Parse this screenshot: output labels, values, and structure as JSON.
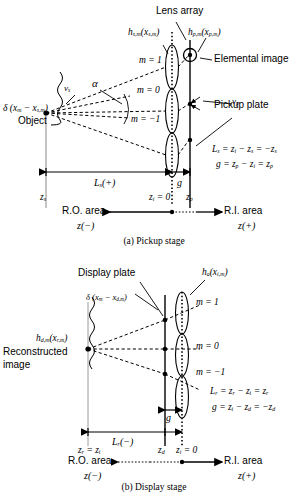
{
  "figure": {
    "colors": {
      "ink": "#000000",
      "paper": "#ffffff"
    }
  },
  "pickup": {
    "caption": "(a) Pickup stage",
    "labels": {
      "lens_array": "Lens array",
      "elemental_image": "Elemental image",
      "pickup_plate": "Pickup plate",
      "object": "Object",
      "h_s": "h",
      "h_s_sub": "s,m",
      "h_s_arg": "(x",
      "h_s_arg_sub": "s,m",
      "h_s_close": ")",
      "h_p": "h",
      "h_p_sub": "p,m",
      "h_p_arg": "(x",
      "h_p_arg_sub": "p,m",
      "h_p_close": ")",
      "delta": "δ (x",
      "delta_sub1": "m",
      "delta_mid": " − x",
      "delta_sub2": "s,m",
      "delta_close": ")",
      "alpha": "α",
      "v_s": "v",
      "v_s_sub": "s",
      "v_p": "v",
      "v_p_sub": "p",
      "m_plus1": "m = 1",
      "m_zero": "m = 0",
      "m_minus1": "m = −1",
      "Ls_span": "L",
      "Ls_span_sub": "s",
      "Ls_span_sign": "(+)",
      "g_span": "g",
      "z_s": "z",
      "z_s_sub": "s",
      "z_i_zero": "z",
      "z_i_zero_sub": "i",
      "z_i_zero_eq": " = 0",
      "z_p": "z",
      "z_p_sub": "p",
      "eq1": "L",
      "eq1_sub": "s",
      "eq1_rest": " = z",
      "eq1_sub2": "i",
      "eq1_rest2": " − z",
      "eq1_sub3": "s",
      "eq1_rest3": " = −z",
      "eq1_sub4": "s",
      "eq2": "g = z",
      "eq2_sub": "p",
      "eq2_rest": " − z",
      "eq2_sub2": "i",
      "eq2_rest2": " = z",
      "eq2_sub3": "p",
      "ro_area": "R.O. area",
      "ro_axis": "z(−)",
      "ri_area": "R.I. area",
      "ri_axis": "z(+)"
    }
  },
  "display": {
    "caption": "(b) Display stage",
    "labels": {
      "display_plate": "Display plate",
      "reconstructed_1": "Reconstructed",
      "reconstructed_2": "image",
      "h_a": "h",
      "h_a_sub": "a",
      "h_a_arg": "(x",
      "h_a_arg_sub": "i,m",
      "h_a_close": ")",
      "h_d": "h",
      "h_d_sub": "d,m",
      "h_d_arg": "(x",
      "h_d_arg_sub": "r,m",
      "h_d_close": ")",
      "delta": "δ (x",
      "delta_sub1": "m",
      "delta_mid": " − x",
      "delta_sub2": "d,m",
      "delta_close": ")",
      "m_plus1": "m = 1",
      "m_zero": "m = 0",
      "m_minus1": "m = −1",
      "Lr_span": "L",
      "Lr_span_sub": "r",
      "Lr_span_sign": "(−)",
      "g_span": "g",
      "z_r_eq": "z",
      "z_r_sub": "r",
      "z_r_rest": " = z",
      "z_r_sub2": "i",
      "z_d": "z",
      "z_d_sub": "d",
      "z_i_zero": "z",
      "z_i_zero_sub": "i",
      "z_i_zero_eq": " = 0",
      "eq1": "L",
      "eq1_sub": "r",
      "eq1_rest": " = z",
      "eq1_sub2": "r",
      "eq1_rest2": " − z",
      "eq1_sub3": "i",
      "eq1_rest3": " = z",
      "eq1_sub4": "r",
      "eq2": "g = z",
      "eq2_sub": "i",
      "eq2_rest": " − z",
      "eq2_sub2": "d",
      "eq2_rest2": " = −z",
      "eq2_sub3": "d",
      "ro_area": "R.O. area",
      "ro_axis": "z(−)",
      "ri_area": "R.I. area",
      "ri_axis": "z(+)"
    }
  }
}
